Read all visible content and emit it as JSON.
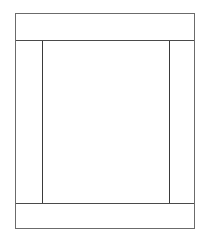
{
  "diagram": {
    "type": "page-layout-wireframe",
    "regions": [
      {
        "id": "header",
        "label": ""
      },
      {
        "id": "left-sidebar",
        "label": ""
      },
      {
        "id": "main-content",
        "label": ""
      },
      {
        "id": "right-sidebar",
        "label": ""
      },
      {
        "id": "footer",
        "label": ""
      }
    ],
    "colors": {
      "background": "#ffffff",
      "stroke": "#5a5a5a"
    }
  }
}
